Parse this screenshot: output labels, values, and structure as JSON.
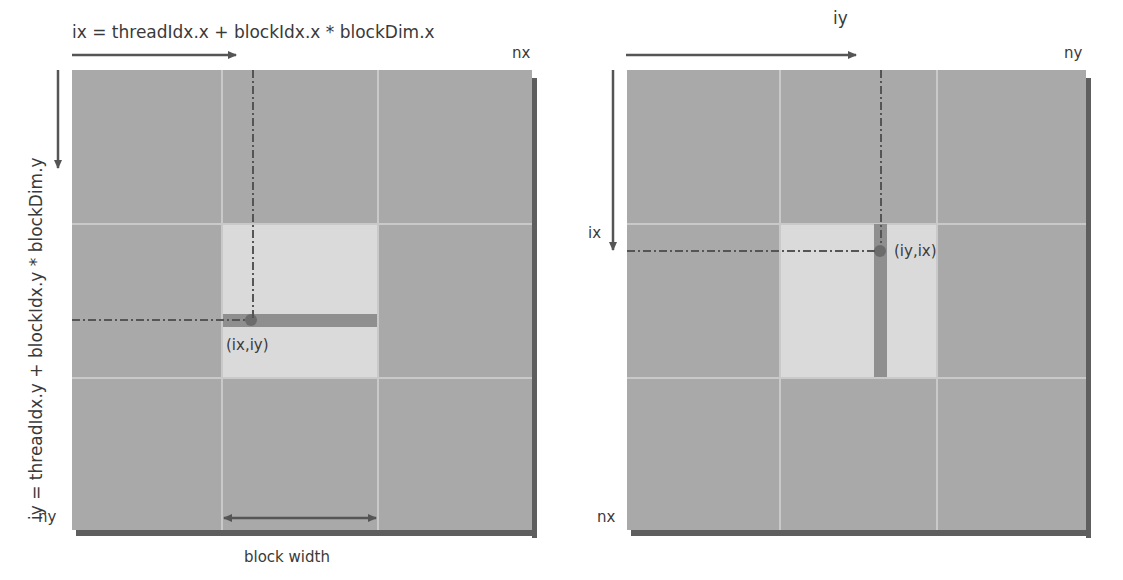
{
  "left_panel": {
    "top_formula": "ix = threadIdx.x + blockIdx.x * blockDim.x",
    "side_formula": "iy = threadIdx.y + blockIdx.y * blockDim.y",
    "corner_top_right": "nx",
    "corner_bottom_left": "ny",
    "point_label": "(ix,iy)",
    "bottom_label": "block width",
    "strip_orientation": "horizontal row"
  },
  "right_panel": {
    "top_label": "iy",
    "side_label": "ix",
    "corner_top_right": "ny",
    "corner_bottom_left": "nx",
    "point_label": "(iy,ix)",
    "strip_orientation": "vertical column"
  },
  "colors": {
    "grid_fill": "#a9a9a9",
    "grid_lines": "#c9c9c9",
    "highlight_block": "#dadada",
    "strip": "#8f8f8f",
    "shadow": "#5e5e5e",
    "arrow": "#555555"
  }
}
